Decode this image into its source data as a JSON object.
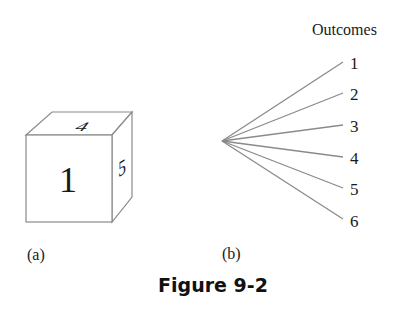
{
  "figure": {
    "caption": "Figure 9-2",
    "panel_a": {
      "label": "(a)",
      "die": {
        "front_face": "1",
        "top_face": "4",
        "right_face": "5"
      }
    },
    "panel_b": {
      "label": "(b)",
      "header": "Outcomes",
      "outcomes": [
        "1",
        "2",
        "3",
        "4",
        "5",
        "6"
      ]
    },
    "colors": {
      "line": "#8a8a8a",
      "text": "#1a1a1a"
    }
  }
}
